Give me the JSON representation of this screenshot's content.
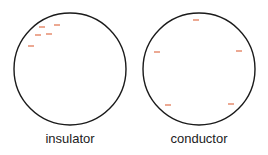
{
  "diagram": {
    "colors": {
      "outline": "#1a1a1a",
      "charge": "#e0704a"
    },
    "panels": [
      {
        "label": "insulator",
        "circle": {
          "cx": 70,
          "cy": 69,
          "r": 56
        },
        "charges": [
          {
            "x": 42,
            "y": 27
          },
          {
            "x": 57,
            "y": 25
          },
          {
            "x": 38,
            "y": 35
          },
          {
            "x": 49,
            "y": 34
          },
          {
            "x": 31,
            "y": 46
          }
        ]
      },
      {
        "label": "conductor",
        "circle": {
          "cx": 199,
          "cy": 69,
          "r": 56
        },
        "charges": [
          {
            "x": 196,
            "y": 20
          },
          {
            "x": 157,
            "y": 52
          },
          {
            "x": 239,
            "y": 51
          },
          {
            "x": 168,
            "y": 105
          },
          {
            "x": 231,
            "y": 104
          }
        ]
      }
    ],
    "charge_symbol": "−"
  }
}
